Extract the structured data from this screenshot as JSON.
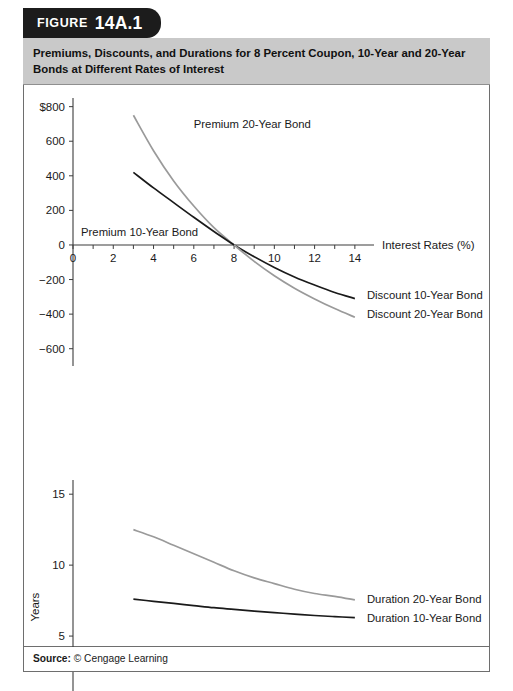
{
  "figure": {
    "badge_label": "FIGURE",
    "badge_number": "14A.1",
    "title": "Premiums, Discounts, and Durations for 8 Percent Coupon, 10-Year and 20-Year Bonds at Different Rates of Interest",
    "source_prefix": "Source:",
    "source_text": "© Cengage Learning"
  },
  "colors": {
    "badge_bg": "#1c1c1c",
    "title_bg": "#c9c9c9",
    "border": "#6e6e6e",
    "series_dark": "#1a1a1a",
    "series_light": "#9a9a9a"
  },
  "chart_data": [
    {
      "type": "line",
      "id": "premium-discount-chart",
      "title": "",
      "xlabel": "Interest Rates (%)",
      "ylabel": "",
      "xlim": [
        0,
        15
      ],
      "ylim": [
        -700,
        850
      ],
      "grid": false,
      "legend": "inline-annotations",
      "xticks": [
        0,
        1,
        2,
        3,
        4,
        5,
        6,
        7,
        8,
        9,
        10,
        11,
        12,
        13,
        14
      ],
      "xticklabels": [
        "0",
        "",
        "2",
        "",
        "4",
        "",
        "6",
        "",
        "8",
        "",
        "10",
        "",
        "12",
        "",
        "14"
      ],
      "yticks": [
        -600,
        -400,
        -200,
        0,
        200,
        400,
        600,
        800
      ],
      "yticklabels": [
        "−600",
        "−400",
        "−200",
        "0",
        "200",
        "400",
        "600",
        "$800"
      ],
      "series": [
        {
          "name": "Premium 20-Year Bond",
          "color": "#9a9a9a",
          "label_x": 6.0,
          "label_y": 700,
          "x": [
            3,
            4,
            5,
            6,
            7,
            8
          ],
          "values": [
            750,
            545,
            370,
            225,
            100,
            0
          ]
        },
        {
          "name": "Premium 10-Year Bond",
          "color": "#1a1a1a",
          "label_x": 0.4,
          "label_y": 75,
          "x": [
            3,
            4,
            5,
            6,
            7,
            8
          ],
          "values": [
            420,
            330,
            245,
            160,
            78,
            0
          ]
        },
        {
          "name": "Discount 10-Year Bond",
          "color": "#1a1a1a",
          "label_x": 14.6,
          "label_y": -290,
          "x": [
            8,
            9,
            10,
            11,
            12,
            13,
            14
          ],
          "values": [
            0,
            -68,
            -130,
            -185,
            -232,
            -275,
            -310
          ]
        },
        {
          "name": "Discount 20-Year Bond",
          "color": "#9a9a9a",
          "label_x": 14.6,
          "label_y": -400,
          "x": [
            8,
            9,
            10,
            11,
            12,
            13,
            14
          ],
          "values": [
            0,
            -95,
            -178,
            -250,
            -312,
            -368,
            -418
          ]
        }
      ]
    },
    {
      "type": "line",
      "id": "duration-chart",
      "title": "",
      "xlabel": "Interest Rates (%)",
      "ylabel": "Years",
      "xlim": [
        0,
        15
      ],
      "ylim": [
        0,
        16
      ],
      "grid": false,
      "legend": "inline-annotations",
      "xticks": [
        0,
        1,
        2,
        3,
        4,
        5,
        6,
        7,
        8,
        9,
        10,
        11,
        12,
        13,
        14
      ],
      "xticklabels": [
        "0",
        "",
        "2",
        "",
        "4",
        "",
        "6",
        "",
        "8",
        "",
        "10",
        "",
        "12",
        "",
        "14"
      ],
      "yticks": [
        5,
        10,
        15
      ],
      "yticklabels": [
        "5",
        "10",
        "15"
      ],
      "series": [
        {
          "name": "Duration 20-Year Bond",
          "color": "#9a9a9a",
          "label_x": 14.6,
          "label_y": 7.6,
          "x": [
            3,
            4,
            5,
            6,
            7,
            8,
            9,
            10,
            11,
            12,
            13,
            14
          ],
          "values": [
            12.5,
            12.0,
            11.4,
            10.8,
            10.2,
            9.6,
            9.1,
            8.7,
            8.3,
            8.0,
            7.8,
            7.55
          ]
        },
        {
          "name": "Duration 10-Year Bond",
          "color": "#1a1a1a",
          "label_x": 14.6,
          "label_y": 6.3,
          "x": [
            3,
            4,
            5,
            6,
            7,
            8,
            9,
            10,
            11,
            12,
            13,
            14
          ],
          "values": [
            7.6,
            7.45,
            7.3,
            7.15,
            7.0,
            6.88,
            6.76,
            6.65,
            6.55,
            6.45,
            6.37,
            6.3
          ]
        }
      ]
    }
  ]
}
